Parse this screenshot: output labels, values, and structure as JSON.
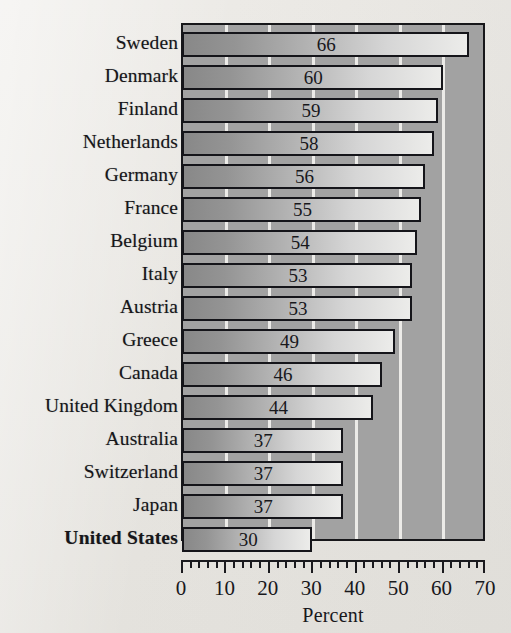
{
  "chart_data": {
    "type": "bar",
    "orientation": "horizontal",
    "title": "",
    "xlabel": "Percent",
    "ylabel": "",
    "xlim": [
      0,
      70
    ],
    "grid": true,
    "grid_axis": "x",
    "legend": "none",
    "value_labels_shown": true,
    "highlight_category": "United States",
    "categories": [
      "Sweden",
      "Denmark",
      "Finland",
      "Netherlands",
      "Germany",
      "France",
      "Belgium",
      "Italy",
      "Austria",
      "Greece",
      "Canada",
      "United Kingdom",
      "Australia",
      "Switzerland",
      "Japan",
      "United States"
    ],
    "values": [
      66,
      60,
      59,
      58,
      56,
      55,
      54,
      53,
      53,
      49,
      46,
      44,
      37,
      37,
      37,
      30
    ],
    "axis": {
      "major_tick_values": [
        0,
        10,
        20,
        30,
        40,
        50,
        60,
        70
      ],
      "major_tick_labels": [
        "0",
        "10",
        "20",
        "30",
        "40",
        "50",
        "60",
        "70"
      ],
      "minor_tick_step": 2
    },
    "colors": {
      "plot_background": "#a2a2a2",
      "gridline": "#f2f1ee",
      "bar_gradient_start": "#888888",
      "bar_gradient_end": "#ececea",
      "bar_outline": "#15151a",
      "text": "#18181c",
      "page_background": "#e9e7e3"
    }
  }
}
